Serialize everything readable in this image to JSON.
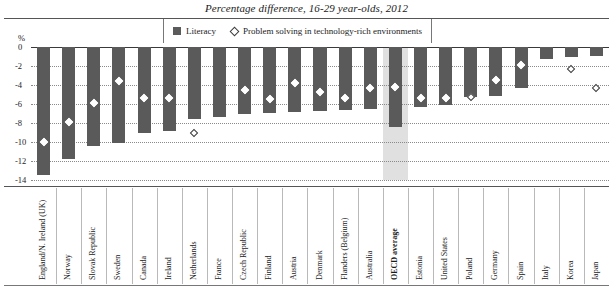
{
  "chart_data": {
    "type": "bar",
    "title": "Percentage difference, 16-29 year-olds, 2012",
    "xlabel": "",
    "ylabel": "%",
    "ylim": [
      -14,
      0
    ],
    "yticks": [
      0,
      -2,
      -4,
      -6,
      -8,
      -10,
      -12,
      -14
    ],
    "ytick_labels": [
      "0",
      "-2",
      "-4",
      "-6",
      "-8",
      "-10",
      "-12",
      "-14"
    ],
    "grid": true,
    "legend_position": "top-center",
    "legend": [
      "Literacy",
      "Problem solving in technology-rich environments"
    ],
    "highlight_category": "OECD average",
    "categories": [
      "England/N. Ireland (UK)",
      "Norway",
      "Slovak Republic",
      "Sweden",
      "Canada",
      "Ireland",
      "Netherlands",
      "France",
      "Czech Republic",
      "Finland",
      "Austria",
      "Denmark",
      "Flanders (Belgium)",
      "Australia",
      "OECD average",
      "Estonia",
      "United States",
      "Poland",
      "Germany",
      "Spain",
      "Italy",
      "Korea",
      "Japan"
    ],
    "series": [
      {
        "name": "Literacy",
        "type": "bar",
        "values": [
          -13.5,
          -11.8,
          -10.4,
          -10.1,
          -9.0,
          -8.8,
          -7.6,
          -7.4,
          -7.0,
          -6.9,
          -6.8,
          -6.7,
          -6.6,
          -6.5,
          -8.4,
          -6.3,
          -6.1,
          -5.3,
          -5.2,
          -4.3,
          -1.3,
          -1.1,
          -0.9
        ]
      },
      {
        "name": "Problem solving in technology-rich environments",
        "type": "scatter-diamond",
        "values": [
          -10.0,
          -7.9,
          -5.9,
          -3.6,
          -5.4,
          -5.4,
          -9.0,
          null,
          -4.5,
          -5.5,
          -3.8,
          -4.7,
          -5.4,
          -4.3,
          -4.2,
          -5.4,
          -5.4,
          -5.3,
          -3.5,
          -1.9,
          null,
          -2.3,
          -4.3
        ]
      }
    ]
  },
  "legend": {
    "literacy_label": "Literacy",
    "problem_solving_label": "Problem solving in technology-rich environments"
  },
  "axis": {
    "unit": "%"
  }
}
